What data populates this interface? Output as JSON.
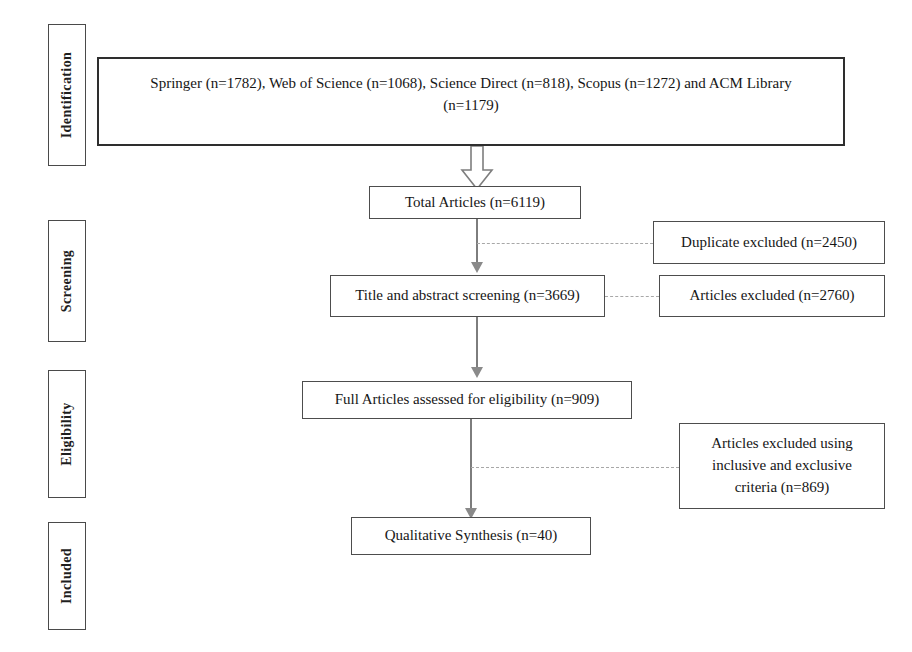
{
  "diagram": {
    "stages": [
      {
        "id": "identification",
        "label": "Identification"
      },
      {
        "id": "screening",
        "label": "Screening"
      },
      {
        "id": "eligibility",
        "label": "Eligibility"
      },
      {
        "id": "included",
        "label": "Included"
      }
    ],
    "boxes": {
      "sources": {
        "line1": "Springer (n=1782), Web of Science (n=1068), Science Direct (n=818), Scopus (n=1272) and ACM Library",
        "line2": "(n=1179)"
      },
      "total_articles": "Total Articles (n=6119)",
      "duplicate_excluded": "Duplicate excluded (n=2450)",
      "title_abstract_screening": "Title and abstract screening (n=3669)",
      "articles_excluded": "Articles excluded (n=2760)",
      "full_articles_eligibility": "Full Articles assessed for eligibility (n=909)",
      "excluded_criteria": {
        "line1": "Articles excluded using",
        "line2": "inclusive and exclusive",
        "line3": "criteria (n=869)"
      },
      "qualitative_synthesis": "Qualitative Synthesis (n=40)"
    },
    "counts": {
      "springer": 1782,
      "web_of_science": 1068,
      "science_direct": 818,
      "scopus": 1272,
      "acm_library": 1179,
      "total_articles": 6119,
      "duplicate_excluded": 2450,
      "title_abstract_screening": 3669,
      "articles_excluded": 2760,
      "full_articles_eligibility": 909,
      "excluded_by_criteria": 869,
      "qualitative_synthesis": 40
    },
    "colors": {
      "background": "#ffffff",
      "box_border": "#4d4d4d",
      "heavy_border": "#2e2e2e",
      "connector": "#7d7d7d",
      "dashed_connector": "#a8a8a8",
      "text": "#161616"
    }
  }
}
